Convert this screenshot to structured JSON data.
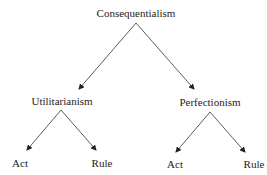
{
  "diagram": {
    "type": "tree",
    "root": {
      "label": "Consequentialism",
      "x": 136,
      "y": 13
    },
    "level1": [
      {
        "label": "Utilitarianism",
        "x": 62,
        "y": 101
      },
      {
        "label": "Perfectionism",
        "x": 210,
        "y": 102
      }
    ],
    "leaves": [
      {
        "label": "Act",
        "x": 20,
        "y": 163,
        "parent": "Utilitarianism"
      },
      {
        "label": "Rule",
        "x": 102,
        "y": 163,
        "parent": "Utilitarianism"
      },
      {
        "label": "Act",
        "x": 175,
        "y": 164,
        "parent": "Perfectionism"
      },
      {
        "label": "Rule",
        "x": 254,
        "y": 164,
        "parent": "Perfectionism"
      }
    ],
    "edges": [
      {
        "from": "Consequentialism",
        "to": "Utilitarianism"
      },
      {
        "from": "Consequentialism",
        "to": "Perfectionism"
      },
      {
        "from": "Utilitarianism",
        "to": "Act"
      },
      {
        "from": "Utilitarianism",
        "to": "Rule"
      },
      {
        "from": "Perfectionism",
        "to": "Act"
      },
      {
        "from": "Perfectionism",
        "to": "Rule"
      }
    ]
  }
}
